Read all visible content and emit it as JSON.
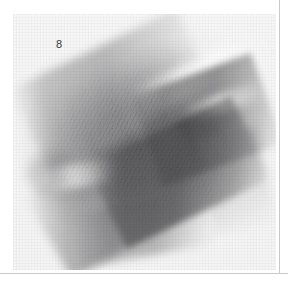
{
  "page": {
    "background_color": "#ffffff",
    "width": 288,
    "height": 285
  },
  "rules": {
    "vertical_color": "#c9c9c9",
    "horizontal_color": "#c9c9c9"
  },
  "swatch": {
    "label": "8",
    "label_color": "#3a3a3a",
    "paper_color": "#f5f5f5",
    "medium": "graphite pencil smudge"
  },
  "chart_data": {
    "type": "heatmap",
    "title": "",
    "xlabel": "",
    "ylabel": "",
    "annotations": [
      "8"
    ],
    "legend": [],
    "grid": false,
    "tone_stops": [
      {
        "name": "paper",
        "hex": "#f5f5f5"
      },
      {
        "name": "lightest-smudge",
        "hex": "#d8d8d8"
      },
      {
        "name": "mid-smudge",
        "hex": "#b0b0b2"
      },
      {
        "name": "dark-smudge",
        "hex": "#8e8e90"
      },
      {
        "name": "darkest-core",
        "hex": "#6e6e70"
      }
    ],
    "stroke_angles_deg": [
      -26,
      -20,
      -30,
      -24,
      -10
    ],
    "extent": {
      "x": [
        8,
        244
      ],
      "y": [
        22,
        240
      ]
    }
  }
}
